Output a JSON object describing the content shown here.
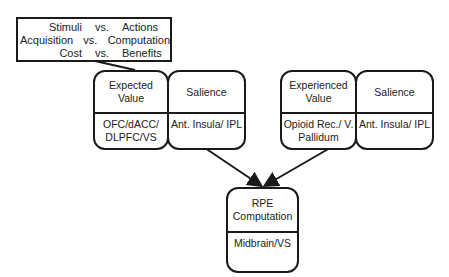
{
  "comparison_box": {
    "rows": [
      {
        "left": "Stimuli",
        "vs": "vs.",
        "right": "Actions"
      },
      {
        "left": "Acquisition",
        "vs": "vs.",
        "right": "Computation"
      },
      {
        "left": "Cost",
        "vs": "vs.",
        "right": "Benefits"
      }
    ]
  },
  "nodes": {
    "expected_value": {
      "title": "Expected Value",
      "region": "OFC/dACC/ DLPFC/VS"
    },
    "salience_left": {
      "title": "Salience",
      "region": "Ant. Insula/ IPL"
    },
    "experienced_value": {
      "title": "Experienced Value",
      "region": "Opioid Rec./ V. Pallidum"
    },
    "salience_right": {
      "title": "Salience",
      "region": "Ant. Insula/ IPL"
    },
    "rpe": {
      "title": "RPE Computation",
      "region": "Midbrain/VS"
    }
  },
  "colors": {
    "stroke": "#1a1a1a",
    "background": "#ffffff"
  }
}
